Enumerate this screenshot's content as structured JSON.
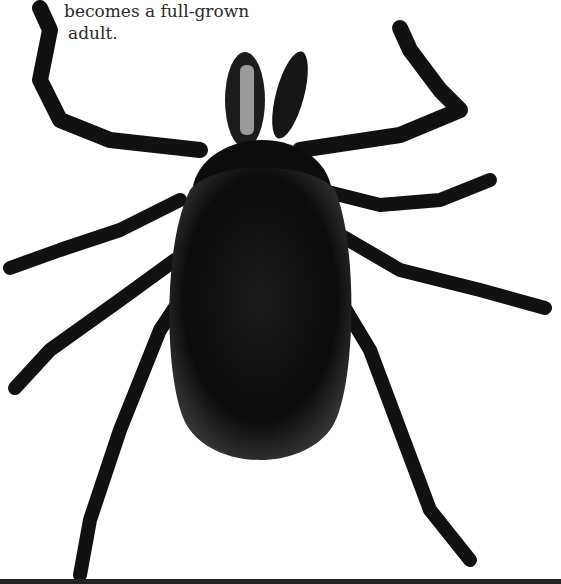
{
  "caption": {
    "line1": "becomes a full-grown",
    "line2": "adult."
  },
  "image": {
    "subject": "tick-adult",
    "style": "black-and-white photograph",
    "background": "#ffffff",
    "body_color": "#111111"
  }
}
